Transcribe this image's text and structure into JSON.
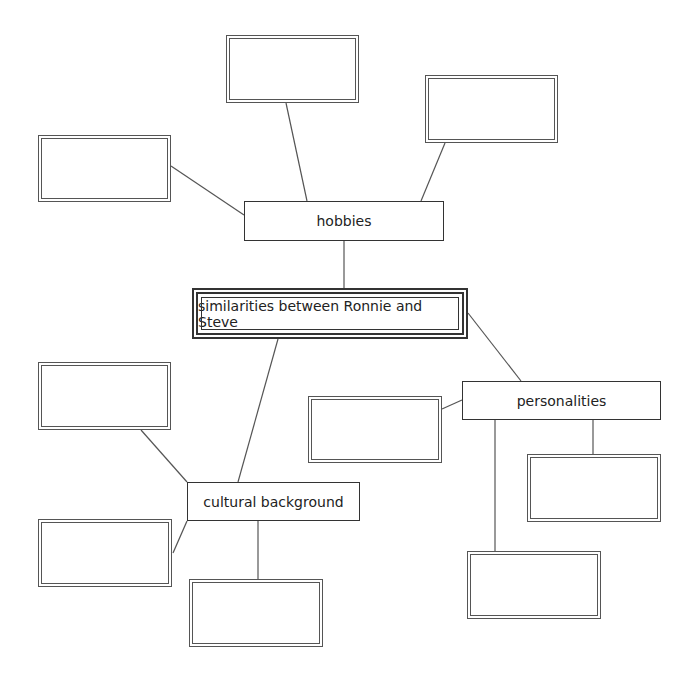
{
  "diagram": {
    "type": "concept-map",
    "center": {
      "label": "similarities between Ronnie and Steve"
    },
    "categories": [
      {
        "id": "hobbies",
        "label": "hobbies",
        "blank_boxes": 3
      },
      {
        "id": "cultural",
        "label": "cultural background",
        "blank_boxes": 3
      },
      {
        "id": "personalities",
        "label": "personalities",
        "blank_boxes": 3
      }
    ],
    "blanks": {
      "b1": "",
      "b2": "",
      "b3": "",
      "b4": "",
      "b5": "",
      "b6": "",
      "b7": "",
      "b8": "",
      "b9": ""
    },
    "colors": {
      "line": "#555555",
      "border": "#333333",
      "background": "#ffffff"
    }
  }
}
